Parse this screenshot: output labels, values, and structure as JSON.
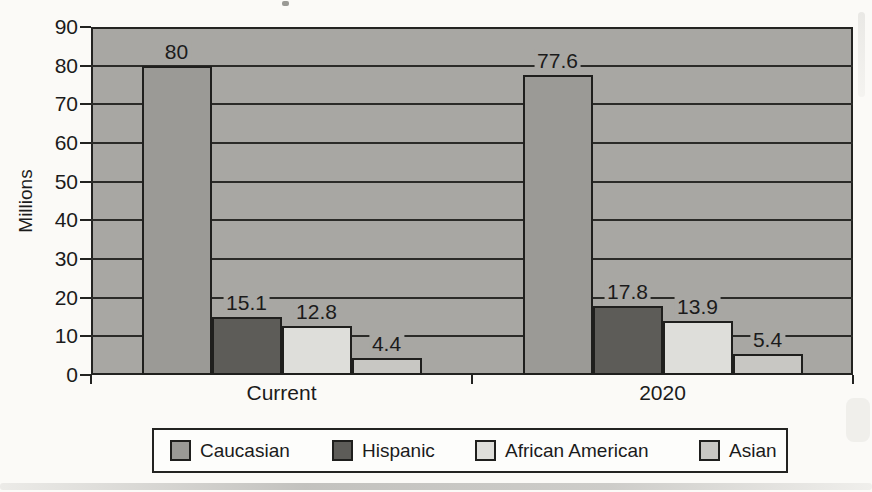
{
  "chart_data": {
    "type": "bar",
    "title": "",
    "ylabel": "Millions",
    "categories": [
      "Current",
      "2020"
    ],
    "series": [
      {
        "name": "Caucasian",
        "values": [
          80,
          77.6
        ],
        "value_labels": [
          "80",
          "77.6"
        ],
        "color": "#9b9a96"
      },
      {
        "name": "Hispanic",
        "values": [
          15.1,
          17.8
        ],
        "value_labels": [
          "15.1",
          "17.8"
        ],
        "color": "#5d5c58"
      },
      {
        "name": "African American",
        "values": [
          12.8,
          13.9
        ],
        "value_labels": [
          "12.8",
          "13.9"
        ],
        "color": "#dededa"
      },
      {
        "name": "Asian",
        "values": [
          4.4,
          5.4
        ],
        "value_labels": [
          "4.4",
          "5.4"
        ],
        "color": "#c8c7c3"
      }
    ],
    "ylim": [
      0,
      90
    ],
    "yticks": [
      0,
      10,
      20,
      30,
      40,
      50,
      60,
      70,
      80,
      90
    ],
    "ytick_labels": [
      "0",
      "10",
      "20",
      "30",
      "40",
      "50",
      "60",
      "70",
      "80",
      "90"
    ],
    "grid": "horizontal",
    "legend_position": "bottom",
    "legend_labels": [
      "Caucasian",
      "Hispanic",
      "African American",
      "Asian"
    ],
    "plot_bg": "#a8a7a3",
    "axis_color": "#232321",
    "text_color": "#1b1b1b"
  }
}
